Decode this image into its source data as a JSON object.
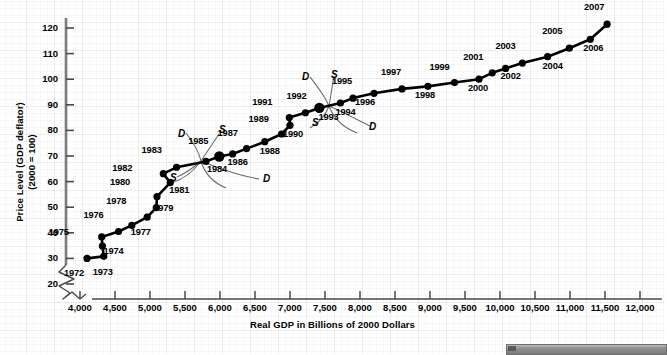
{
  "chart_data": {
    "type": "scatter",
    "title": "",
    "xlabel": "Real GDP in Billions of 2000 Dollars",
    "ylabel": "Price Level (GDP deflator) (2000 = 100)",
    "ylabel_line1": "Price Level (GDP deflator)",
    "ylabel_line2": "(2000 = 100)",
    "xlim": [
      3800,
      12000
    ],
    "ylim": [
      15,
      126
    ],
    "axis_break": true,
    "grid": true,
    "legend_position": "none",
    "xticks": [
      "4,000",
      "4,500",
      "5,000",
      "5,500",
      "6,000",
      "6,500",
      "7,000",
      "7,500",
      "8,000",
      "8,500",
      "9,000",
      "9,500",
      "10,000",
      "10,500",
      "11,000",
      "11,500",
      "12,000"
    ],
    "xtick_values": [
      4000,
      4500,
      5000,
      5500,
      6000,
      6500,
      7000,
      7500,
      8000,
      8500,
      9000,
      9500,
      10000,
      10500,
      11000,
      11500,
      12000
    ],
    "yticks": [
      "20",
      "30",
      "40",
      "50",
      "60",
      "70",
      "80",
      "90",
      "100",
      "110",
      "120"
    ],
    "ytick_values": [
      20,
      30,
      40,
      50,
      60,
      70,
      80,
      90,
      100,
      110,
      120
    ],
    "points": [
      {
        "label": "1972",
        "x": 4100,
        "y": 30.0,
        "lx": -14,
        "ly": 16
      },
      {
        "label": "1973",
        "x": 4340,
        "y": 30.8,
        "lx": -2,
        "ly": 17
      },
      {
        "label": "1974",
        "x": 4320,
        "y": 34.8,
        "lx": 10,
        "ly": 6
      },
      {
        "label": "1975",
        "x": 4310,
        "y": 38.4,
        "lx": -44,
        "ly": -4
      },
      {
        "label": "1976",
        "x": 4550,
        "y": 40.5,
        "lx": -26,
        "ly": -16
      },
      {
        "label": "1977",
        "x": 4740,
        "y": 42.9,
        "lx": 8,
        "ly": 8
      },
      {
        "label": "1978",
        "x": 4960,
        "y": 46.1,
        "lx": -32,
        "ly": -15
      },
      {
        "label": "1979",
        "x": 5090,
        "y": 49.8,
        "lx": 6,
        "ly": 1
      },
      {
        "label": "1980",
        "x": 5100,
        "y": 54.1,
        "lx": -38,
        "ly": -14
      },
      {
        "label": "1981",
        "x": 5290,
        "y": 59.6,
        "lx": 8,
        "ly": 8
      },
      {
        "label": "1982",
        "x": 5190,
        "y": 63.1,
        "lx": -42,
        "ly": -5
      },
      {
        "label": "1983",
        "x": 5380,
        "y": 65.6,
        "lx": -26,
        "ly": -16
      },
      {
        "label": "1984",
        "x": 5800,
        "y": 67.9,
        "lx": 10,
        "ly": 9
      },
      {
        "label": "1985",
        "x": 5990,
        "y": 69.8,
        "lx": -22,
        "ly": -15
      },
      {
        "label": "1986",
        "x": 6180,
        "y": 70.8,
        "lx": 4,
        "ly": 9
      },
      {
        "label": "1987",
        "x": 6380,
        "y": 72.9,
        "lx": -20,
        "ly": -15
      },
      {
        "label": "1988",
        "x": 6640,
        "y": 75.6,
        "lx": 4,
        "ly": 10
      },
      {
        "label": "1989",
        "x": 6880,
        "y": 78.6,
        "lx": -24,
        "ly": -14
      },
      {
        "label": "1990",
        "x": 7000,
        "y": 82.0,
        "lx": 2,
        "ly": 10
      },
      {
        "label": "1991",
        "x": 6990,
        "y": 85.0,
        "lx": -28,
        "ly": -15
      },
      {
        "label": "1992",
        "x": 7220,
        "y": 86.9,
        "lx": -10,
        "ly": -16
      },
      {
        "label": "1993",
        "x": 7420,
        "y": 88.8,
        "lx": 8,
        "ly": 10
      },
      {
        "label": "1994",
        "x": 7720,
        "y": 90.7,
        "lx": 4,
        "ly": 10
      },
      {
        "label": "1995",
        "x": 7900,
        "y": 92.6,
        "lx": -12,
        "ly": -16
      },
      {
        "label": "1996",
        "x": 8200,
        "y": 94.5,
        "lx": -10,
        "ly": 10
      },
      {
        "label": "1997",
        "x": 8600,
        "y": 96.2,
        "lx": -12,
        "ly": -16
      },
      {
        "label": "1998",
        "x": 8970,
        "y": 97.2,
        "lx": -4,
        "ly": 10
      },
      {
        "label": "1999",
        "x": 9350,
        "y": 98.7,
        "lx": -16,
        "ly": -15
      },
      {
        "label": "2000",
        "x": 9700,
        "y": 100.0,
        "lx": -2,
        "ly": 10
      },
      {
        "label": "2001",
        "x": 9890,
        "y": 102.5,
        "lx": -20,
        "ly": -15
      },
      {
        "label": "2002",
        "x": 10080,
        "y": 104.2,
        "lx": 4,
        "ly": 9
      },
      {
        "label": "2003",
        "x": 10320,
        "y": 106.3,
        "lx": -18,
        "ly": -16
      },
      {
        "label": "2004",
        "x": 10680,
        "y": 108.8,
        "lx": 4,
        "ly": 10
      },
      {
        "label": "2005",
        "x": 10990,
        "y": 112.1,
        "lx": -18,
        "ly": -16
      },
      {
        "label": "2006",
        "x": 11290,
        "y": 115.6,
        "lx": 2,
        "ly": 10
      },
      {
        "label": "2007",
        "x": 11530,
        "y": 121.5,
        "lx": -14,
        "ly": -16
      }
    ],
    "annotations": [
      {
        "text": "D",
        "name": "demand-curve-label-1985",
        "x": 178,
        "y": 128
      },
      {
        "text": "S",
        "name": "supply-curve-label-1985",
        "x": 219,
        "y": 124
      },
      {
        "text": "S",
        "name": "supply-curve-label-lower-1985",
        "x": 170,
        "y": 172
      },
      {
        "text": "D",
        "name": "demand-curve-label-lower-1985",
        "x": 263,
        "y": 173
      },
      {
        "text": "D",
        "name": "demand-curve-label-1993",
        "x": 302,
        "y": 71
      },
      {
        "text": "S",
        "name": "supply-curve-label-1993",
        "x": 331,
        "y": 69
      },
      {
        "text": "S",
        "name": "supply-curve-label-lower-1993",
        "x": 312,
        "y": 117
      },
      {
        "text": "D",
        "name": "demand-curve-label-lower-1993",
        "x": 369,
        "y": 121
      }
    ],
    "series_name": "US price level vs real GDP 1972-2007",
    "marker_color": "#000000",
    "line_color": "#000000"
  }
}
